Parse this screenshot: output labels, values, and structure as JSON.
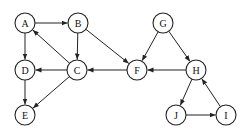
{
  "diagram": {
    "type": "directed-graph",
    "nodes": [
      {
        "id": "A",
        "label": "A",
        "x": 25,
        "y": 23
      },
      {
        "id": "B",
        "label": "B",
        "x": 78,
        "y": 23
      },
      {
        "id": "C",
        "label": "C",
        "x": 77,
        "y": 70
      },
      {
        "id": "D",
        "label": "D",
        "x": 25,
        "y": 70
      },
      {
        "id": "E",
        "label": "E",
        "x": 25,
        "y": 115
      },
      {
        "id": "F",
        "label": "F",
        "x": 137,
        "y": 70
      },
      {
        "id": "G",
        "label": "G",
        "x": 163,
        "y": 23
      },
      {
        "id": "H",
        "label": "H",
        "x": 196,
        "y": 70
      },
      {
        "id": "I",
        "label": "I",
        "x": 226,
        "y": 115
      },
      {
        "id": "J",
        "label": "J",
        "x": 176,
        "y": 115
      }
    ],
    "edges": [
      {
        "from": "A",
        "to": "B"
      },
      {
        "from": "A",
        "to": "D"
      },
      {
        "from": "B",
        "to": "C"
      },
      {
        "from": "B",
        "to": "F"
      },
      {
        "from": "C",
        "to": "A"
      },
      {
        "from": "C",
        "to": "D"
      },
      {
        "from": "C",
        "to": "E"
      },
      {
        "from": "D",
        "to": "E"
      },
      {
        "from": "F",
        "to": "C"
      },
      {
        "from": "G",
        "to": "F"
      },
      {
        "from": "G",
        "to": "H"
      },
      {
        "from": "H",
        "to": "F"
      },
      {
        "from": "H",
        "to": "J"
      },
      {
        "from": "J",
        "to": "I"
      },
      {
        "from": "I",
        "to": "H"
      }
    ],
    "node_radius": 10,
    "colors": {
      "stroke": "#222222",
      "fill": "#ffffff",
      "text": "#111111"
    }
  }
}
